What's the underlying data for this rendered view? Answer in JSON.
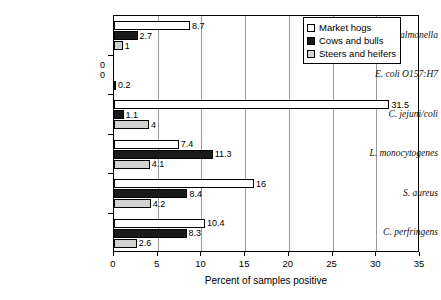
{
  "chart_data": {
    "type": "bar",
    "orientation": "horizontal",
    "title": "",
    "xlabel": "Percent of samples positive",
    "ylabel": "",
    "xlim": [
      0,
      35
    ],
    "xticks": [
      0,
      5,
      10,
      15,
      20,
      25,
      30,
      35
    ],
    "xtick_labels": [
      "0",
      "5",
      "10",
      "15",
      "20",
      "25",
      "30",
      "35"
    ],
    "grid": true,
    "legend_position": "top-right",
    "categories": [
      "Salmonella",
      "E. coli O157:H7",
      "C. jejuni/coli",
      "L. monocytogenes",
      "S. aureus",
      "C. perfringens"
    ],
    "series": [
      {
        "name": "Market hogs",
        "color": "#ffffff",
        "values": [
          8.7,
          0,
          31.5,
          7.4,
          16,
          10.4
        ],
        "labels": [
          "8.7",
          "0",
          "31.5",
          "7.4",
          "16",
          "10.4"
        ]
      },
      {
        "name": "Cows and bulls",
        "color": "#1a1a1a",
        "values": [
          2.7,
          0,
          1.1,
          11.3,
          8.4,
          8.3
        ],
        "labels": [
          "2.7",
          "0",
          "1.1",
          "11.3",
          "8.4",
          "8.3"
        ]
      },
      {
        "name": "Steers and heifers",
        "color": "#d2d2d2",
        "values": [
          1,
          0.2,
          4,
          4.1,
          4.2,
          2.6
        ],
        "labels": [
          "1",
          "0.2",
          "4",
          "4.1",
          "4.2",
          "2.6"
        ]
      }
    ]
  }
}
